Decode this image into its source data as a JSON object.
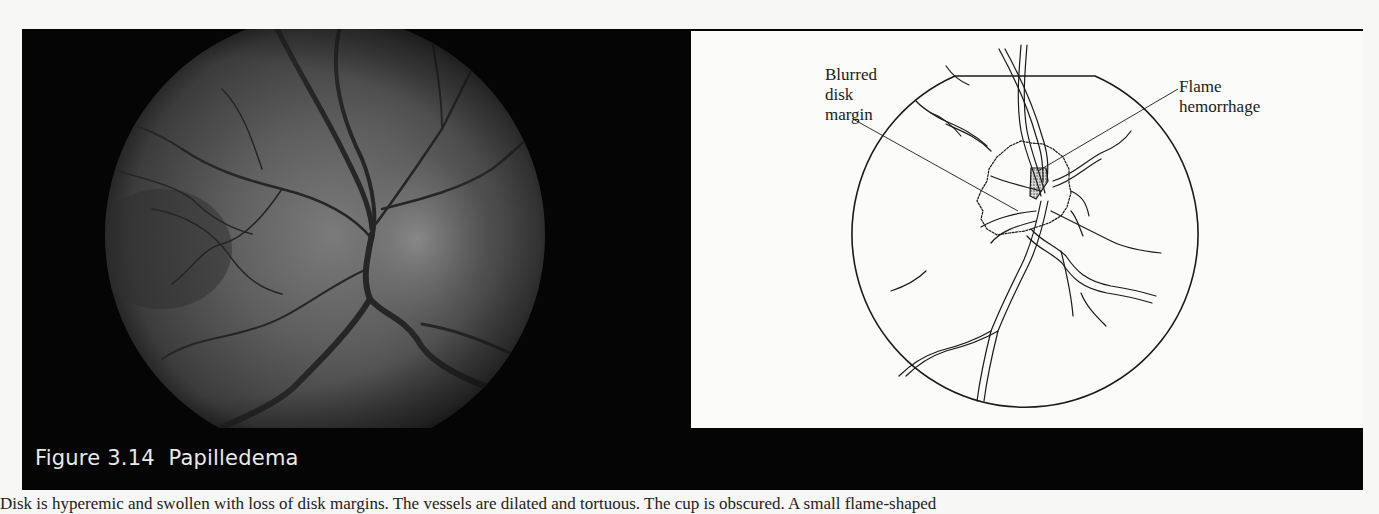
{
  "figure": {
    "caption": "Figure 3.14  Papilledema",
    "number": "3.14",
    "title": "Papilledema"
  },
  "photo": {
    "icon": "fundus-photograph",
    "description": "Fundus photograph of swollen optic disk with dilated vessels"
  },
  "diagram": {
    "icon": "fundus-line-drawing",
    "labels": {
      "blurred_margin": "Blurred\ndisk\nmargin",
      "flame": "Flame\nhemorrhage"
    }
  },
  "body_text": "Disk is hyperemic and swollen with loss of disk margins. The vessels are dilated and tortuous. The cup is obscured. A small flame-shaped",
  "colors": {
    "frame": "#050505",
    "caption_text": "#e9e9e6",
    "page": "#f7f7f5",
    "diagram_bg": "#fbfbfa",
    "fundus_gray": "#5a5a5a"
  }
}
